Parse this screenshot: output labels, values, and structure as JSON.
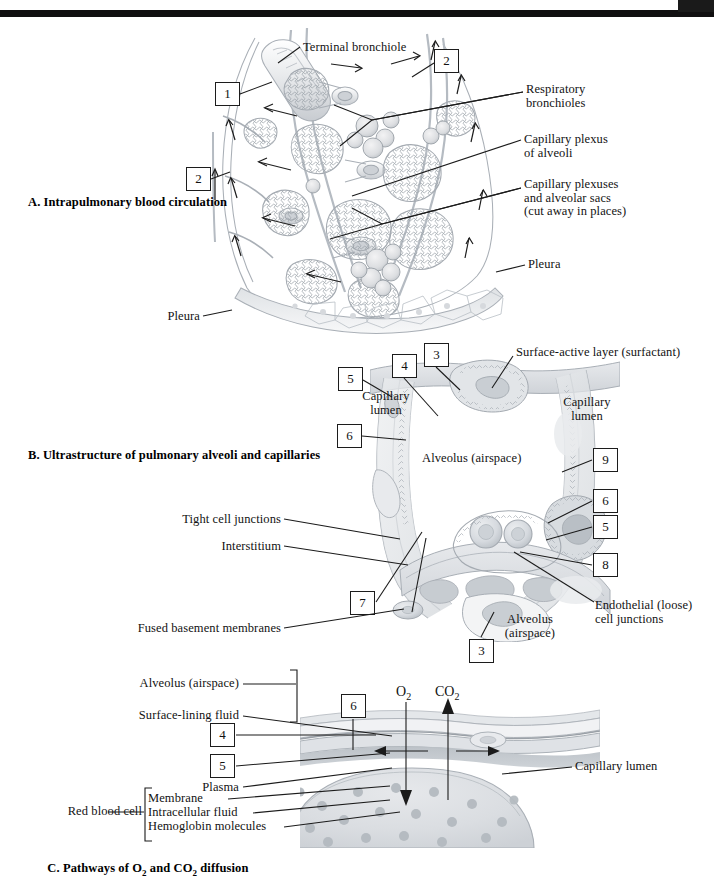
{
  "plate": {
    "title": "Intrapulmonary blood circulation, alveolar ultrastructure and gas diffusion",
    "background_color": "#ffffff",
    "ink_color": "#1b1b1b",
    "illustration_tone": "#9aa0a6"
  },
  "top_bars": {
    "bar_label": "scan-edge-black-bar",
    "block_label": "scan-corner-black-block"
  },
  "panel_a": {
    "section_title": "A. Intrapulmonary blood circulation",
    "labels": [
      {
        "id": "terminal-bronchiole",
        "text": "Terminal bronchiole"
      },
      {
        "id": "respiratory-bronchioles",
        "text": "Respiratory\nbronchioles"
      },
      {
        "id": "capillary-plexus-of-alveoli",
        "text": "Capillary plexus\nof alveoli"
      },
      {
        "id": "capillary-plexuses-and-alveolar-sacs",
        "text": "Capillary plexuses\nand alveolar sacs\n(cut away in places)"
      },
      {
        "id": "pleura-right",
        "text": "Pleura"
      },
      {
        "id": "pleura-bottom",
        "text": "Pleura"
      }
    ],
    "number_boxes": [
      {
        "id": "a-box-1",
        "value": "1"
      },
      {
        "id": "a-box-2-top",
        "value": "2"
      },
      {
        "id": "a-box-2-left",
        "value": "2"
      }
    ]
  },
  "panel_b": {
    "section_title": "B. Ultrastructure of pulmonary alveoli and capillaries",
    "labels": [
      {
        "id": "surface-active-layer",
        "text": "Surface-active layer (surfactant)"
      },
      {
        "id": "capillary-lumen-left",
        "text": "Capillary\nlumen"
      },
      {
        "id": "capillary-lumen-right",
        "text": "Capillary\nlumen"
      },
      {
        "id": "alveolus-airspace-center",
        "text": "Alveolus (airspace)"
      },
      {
        "id": "tight-cell-junctions",
        "text": "Tight cell junctions"
      },
      {
        "id": "interstitium",
        "text": "Interstitium"
      },
      {
        "id": "fused-basement-membranes",
        "text": "Fused basement membranes"
      },
      {
        "id": "endothelial-loose-cell-junctions",
        "text": "Endothelial (loose)\ncell junctions"
      },
      {
        "id": "alveolus-airspace-lower",
        "text": "Alveolus\n(airspace)"
      }
    ],
    "number_boxes": [
      {
        "id": "b-box-3-top",
        "value": "3"
      },
      {
        "id": "b-box-4",
        "value": "4"
      },
      {
        "id": "b-box-5-left",
        "value": "5"
      },
      {
        "id": "b-box-6-left",
        "value": "6"
      },
      {
        "id": "b-box-9",
        "value": "9"
      },
      {
        "id": "b-box-6-right",
        "value": "6"
      },
      {
        "id": "b-box-5-right",
        "value": "5"
      },
      {
        "id": "b-box-8",
        "value": "8"
      },
      {
        "id": "b-box-7",
        "value": "7"
      },
      {
        "id": "b-box-3-bottom",
        "value": "3"
      }
    ]
  },
  "panel_c": {
    "section_title_parts": {
      "prefix": "C. Pathways of O",
      "sub1": "2",
      "mid": " and CO",
      "sub2": "2",
      "suffix": " diffusion"
    },
    "labels": [
      {
        "id": "alveolus-airspace",
        "text": "Alveolus (airspace)"
      },
      {
        "id": "surface-lining-fluid",
        "text": "Surface-lining fluid"
      },
      {
        "id": "plasma",
        "text": "Plasma"
      },
      {
        "id": "red-blood-cell",
        "text": "Red blood cell"
      },
      {
        "id": "membrane",
        "text": "Membrane"
      },
      {
        "id": "intracellular-fluid",
        "text": "Intracellular fluid"
      },
      {
        "id": "hemoglobin-molecules",
        "text": "Hemoglobin molecules"
      },
      {
        "id": "capillary-lumen",
        "text": "Capillary lumen"
      }
    ],
    "gas_arrows": [
      {
        "id": "oxygen-arrow",
        "formula_main": "O",
        "formula_sub": "2",
        "direction": "down",
        "meaning": "O2 diffuses into blood"
      },
      {
        "id": "carbon-dioxide-arrow",
        "formula_main": "CO",
        "formula_sub": "2",
        "direction": "up",
        "meaning": "CO2 diffuses out of blood"
      }
    ],
    "number_boxes": [
      {
        "id": "c-box-6",
        "value": "6"
      },
      {
        "id": "c-box-4",
        "value": "4"
      },
      {
        "id": "c-box-5",
        "value": "5"
      }
    ]
  }
}
